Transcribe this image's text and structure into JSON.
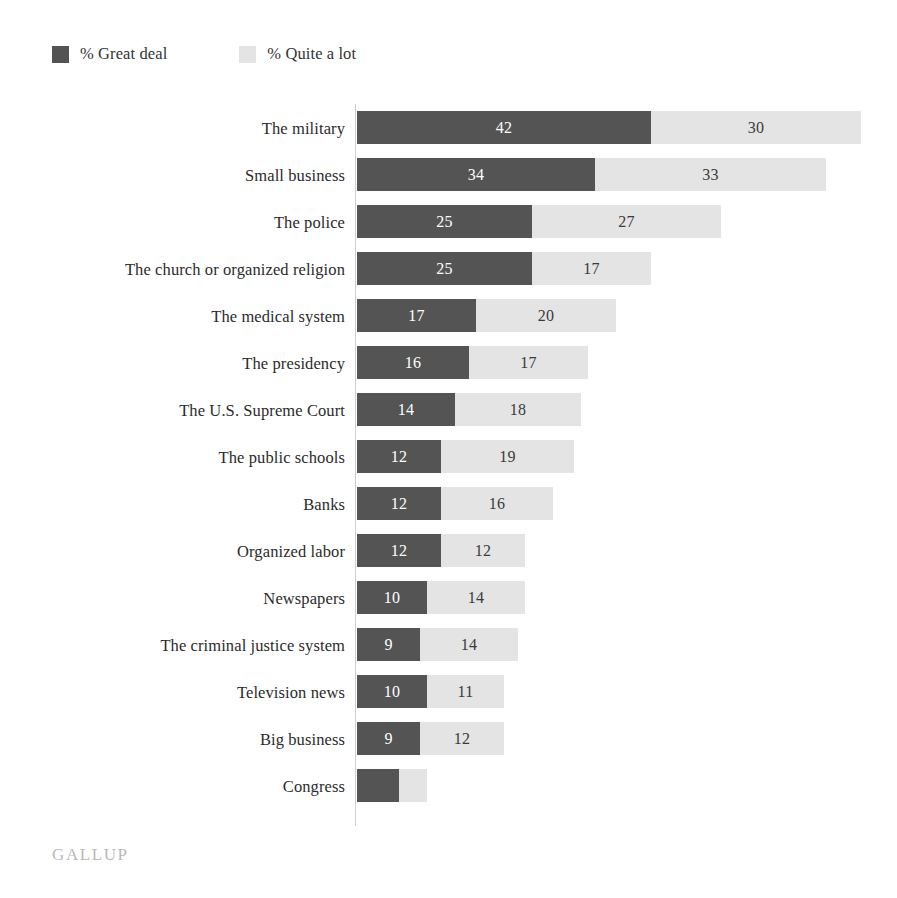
{
  "legend": {
    "items": [
      {
        "label": "% Great deal",
        "color": "#535353",
        "key": "great_deal"
      },
      {
        "label": "% Quite a lot",
        "color": "#e4e4e4",
        "key": "quite_a_lot"
      }
    ]
  },
  "footer": {
    "brand": "GALLUP"
  },
  "chart_data": {
    "type": "bar",
    "orientation": "horizontal",
    "stacked": true,
    "title": "",
    "subtitle": "",
    "xlabel": "",
    "ylabel": "",
    "xlim": [
      0,
      75
    ],
    "grid": false,
    "legend_position": "top-left",
    "px_per_unit": 7,
    "categories": [
      "The military",
      "Small business",
      "The police",
      "The church or organized religion",
      "The medical system",
      "The presidency",
      "The U.S. Supreme Court",
      "The public schools",
      "Banks",
      "Organized labor",
      "Newspapers",
      "The criminal justice system",
      "Television news",
      "Big business",
      "Congress"
    ],
    "series": [
      {
        "name": "% Great deal",
        "color": "#545454",
        "values": [
          42,
          34,
          25,
          25,
          17,
          16,
          14,
          12,
          12,
          12,
          10,
          9,
          10,
          9,
          6
        ],
        "labels": [
          "42",
          "34",
          "25",
          "25",
          "17",
          "16",
          "14",
          "12",
          "12",
          "12",
          "10",
          "9",
          "10",
          "9",
          ""
        ]
      },
      {
        "name": "% Quite a lot",
        "color": "#e4e4e4",
        "values": [
          30,
          33,
          27,
          17,
          20,
          17,
          18,
          19,
          16,
          12,
          14,
          14,
          11,
          12,
          4
        ],
        "labels": [
          "30",
          "33",
          "27",
          "17",
          "20",
          "17",
          "18",
          "19",
          "16",
          "12",
          "14",
          "14",
          "11",
          "12",
          ""
        ]
      }
    ]
  }
}
